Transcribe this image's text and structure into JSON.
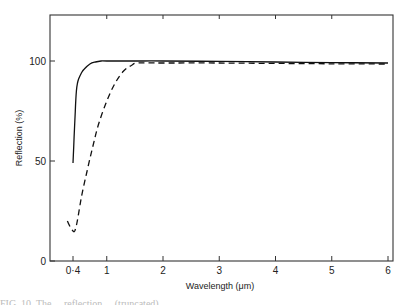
{
  "chart_data": {
    "type": "line",
    "title": "",
    "xlabel": "Wavelength (μm)",
    "ylabel": "Reflection (%)",
    "xlim": [
      0,
      6
    ],
    "ylim": [
      0,
      120
    ],
    "x_ticks": [
      0.4,
      1,
      2,
      3,
      4,
      5,
      6
    ],
    "x_tick_labels": [
      "0·4",
      "1",
      "2",
      "3",
      "4",
      "5",
      "6"
    ],
    "y_ticks": [
      0,
      50,
      100
    ],
    "y_tick_labels": [
      "0",
      "50",
      "100"
    ],
    "grid": false,
    "legend": null,
    "series": [
      {
        "name": "solid",
        "style": "solid",
        "x": [
          0.4,
          0.42,
          0.44,
          0.46,
          0.48,
          0.5,
          0.55,
          0.6,
          0.7,
          0.8,
          0.9,
          1.0,
          1.5,
          2,
          3,
          4,
          5,
          6
        ],
        "y": [
          49,
          62,
          75,
          85,
          89,
          91,
          94,
          96,
          98.5,
          99.5,
          100,
          100,
          100,
          100,
          99.8,
          99.5,
          99.2,
          99
        ]
      },
      {
        "name": "dashed",
        "style": "dashed",
        "x": [
          0.3,
          0.35,
          0.4,
          0.43,
          0.47,
          0.55,
          0.65,
          0.75,
          0.85,
          1.0,
          1.15,
          1.3,
          1.45,
          1.55,
          2,
          3,
          4,
          5,
          6
        ],
        "y": [
          20,
          17,
          15,
          15,
          19,
          32,
          45,
          57,
          68,
          80,
          89,
          95,
          98,
          99,
          99,
          99,
          98.8,
          98.6,
          98.5
        ]
      }
    ]
  },
  "plot": {
    "x_axis_title": "Wavelength (μm)",
    "y_axis_title": "Reflection (%)"
  },
  "caption": {
    "text": "FIG. 10. The ... reflection ... (truncated)"
  }
}
